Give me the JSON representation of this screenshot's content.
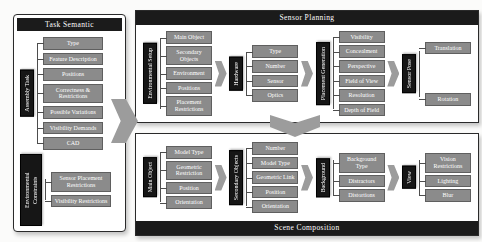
{
  "colors": {
    "title-bar": "#1b1b1b",
    "title-text": "#ffffff",
    "vbox-fill": "#161616",
    "box-fill": "#8b8b8b",
    "box-border": "#5f5f5f",
    "arrow": "#9c9c9c",
    "line": "#4d4d4d"
  },
  "panels": {
    "task_semantic": {
      "title": "Task Semantic",
      "groups": [
        {
          "label": "Assembly Task",
          "items": [
            "Type",
            "Feature Description",
            "Positions",
            "Correctness & Restrictions",
            "Possible Variations",
            "Visibility Demands",
            "CAD"
          ]
        },
        {
          "label": "Environmental Constraints",
          "items": [
            "Sensor Placement Restrictions",
            "Visibility Restrictions"
          ]
        }
      ]
    },
    "sensor_planning": {
      "title": "Sensor Planning",
      "stages": [
        {
          "label": "Environmental Setup",
          "items": [
            "Main Object",
            "Secondary Objects",
            "Environment",
            "Positions",
            "Placement Restrictions"
          ]
        },
        {
          "label": "Hardware",
          "items": [
            "Type",
            "Number",
            "Sensor",
            "Optics"
          ]
        },
        {
          "label": "Placement Generation",
          "items": [
            "Visibility",
            "Concealment",
            "Perspective",
            "Field of View",
            "Resolution",
            "Depth of Field"
          ]
        },
        {
          "label": "Sensor Pose",
          "items": [
            "Translation",
            "Rotation"
          ]
        }
      ]
    },
    "scene_composition": {
      "title": "Scene Composition",
      "stages": [
        {
          "label": "Main Object",
          "items": [
            "Model Type",
            "Geometric Restriction",
            "Position",
            "Orientation"
          ]
        },
        {
          "label": "Secondary Objects",
          "items": [
            "Number",
            "Model Type",
            "Geometric Link",
            "Position",
            "Orientation"
          ]
        },
        {
          "label": "Background",
          "items": [
            "Background Type",
            "Distractors",
            "Distortions"
          ]
        },
        {
          "label": "View",
          "items": [
            "Vision Restrictions",
            "Lighting",
            "Blur"
          ]
        }
      ]
    }
  }
}
